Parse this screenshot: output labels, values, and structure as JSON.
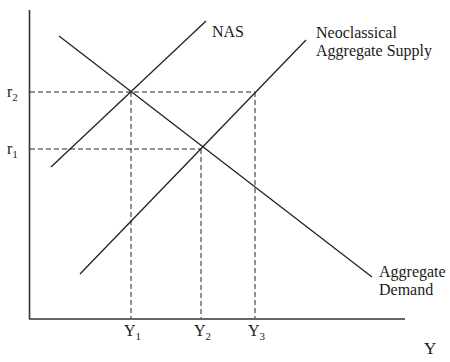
{
  "diagram": {
    "type": "economics-supply-demand",
    "x_axis_label": "Y",
    "y_axis_labels": [
      {
        "base": "r",
        "sub": "2",
        "y": 92
      },
      {
        "base": "r",
        "sub": "1",
        "y": 149
      }
    ],
    "x_ticks": [
      {
        "base": "Y",
        "sub": "1",
        "x": 131
      },
      {
        "base": "Y",
        "sub": "2",
        "x": 201
      },
      {
        "base": "Y",
        "sub": "3",
        "x": 255
      }
    ],
    "curves": [
      {
        "name": "NAS",
        "label_lines": [
          "NAS"
        ],
        "x1": 51,
        "y1": 167,
        "x2": 206,
        "y2": 21
      },
      {
        "name": "Neoclassical Aggregate Supply",
        "label_lines": [
          "Neoclassical",
          "Aggregate Supply"
        ],
        "x1": 80,
        "y1": 274,
        "x2": 306,
        "y2": 40
      },
      {
        "name": "Aggregate Demand",
        "label_lines": [
          "Aggregate",
          "Demand"
        ],
        "x1": 59,
        "y1": 36,
        "x2": 372,
        "y2": 277
      }
    ],
    "equilibria": [
      {
        "label": "NAS ∩ AD",
        "x": 131,
        "y": 92
      },
      {
        "label": "Neoclassical AS ∩ AD",
        "x": 201,
        "y": 149
      },
      {
        "label": "Neoclassical AS at r2",
        "x": 255,
        "y": 92
      }
    ]
  },
  "labels": {
    "nas": "NAS",
    "neo_line1": "Neoclassical",
    "neo_line2": "Aggregate Supply",
    "ad_line1": "Aggregate",
    "ad_line2": "Demand",
    "x_axis": "Y",
    "r2_base": "r",
    "r2_sub": "2",
    "r1_base": "r",
    "r1_sub": "1",
    "y1_base": "Y",
    "y1_sub": "1",
    "y2_base": "Y",
    "y2_sub": "2",
    "y3_base": "Y",
    "y3_sub": "3"
  }
}
